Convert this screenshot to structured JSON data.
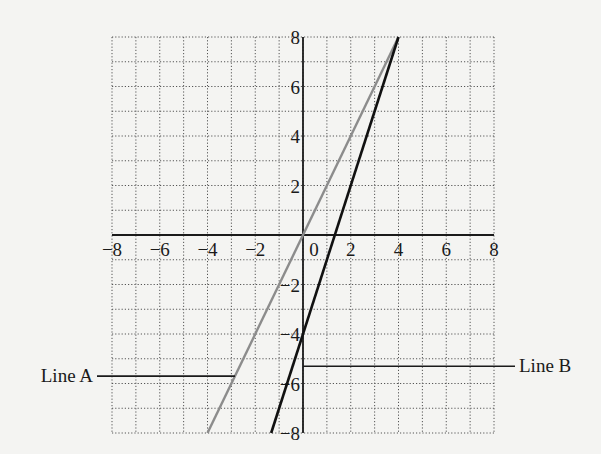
{
  "chart_data": {
    "type": "line",
    "title": "",
    "xlabel": "",
    "ylabel": "",
    "xlim": [
      -8,
      8
    ],
    "ylim": [
      -8,
      8
    ],
    "grid": true,
    "grid_style": "dotted",
    "grid_step": 1,
    "x_ticks": [
      -8,
      -6,
      -4,
      -2,
      0,
      2,
      4,
      6,
      8
    ],
    "x_tick_labels": [
      "−8",
      "−6",
      "−4",
      "−2",
      "0",
      "2",
      "4",
      "6",
      "8"
    ],
    "y_ticks": [
      8,
      6,
      4,
      2,
      -2,
      -4,
      -6,
      -8
    ],
    "y_tick_labels": [
      "8",
      "6",
      "4",
      "2",
      "−2",
      "−4",
      "−6",
      "−8"
    ],
    "series": [
      {
        "name": "Line A",
        "color": "#8c8c8c",
        "equation": "y = 2x",
        "points": [
          [
            -4,
            -8
          ],
          [
            4,
            8
          ]
        ]
      },
      {
        "name": "Line B",
        "color": "#111111",
        "equation": "y = 3x - 4",
        "points": [
          [
            -1.333,
            -8
          ],
          [
            4,
            8
          ]
        ]
      }
    ],
    "annotations": [
      {
        "text": "Line A",
        "side": "left",
        "leader_y": -5.7
      },
      {
        "text": "Line B",
        "side": "right",
        "leader_y": -5.3
      }
    ]
  },
  "labels": {
    "line_a": "Line A",
    "line_b": "Line B"
  },
  "colors": {
    "background": "#f4f4f2",
    "axis": "#1a1a1a",
    "grid": "#555555",
    "line_a": "#8c8c8c",
    "line_b": "#111111"
  }
}
